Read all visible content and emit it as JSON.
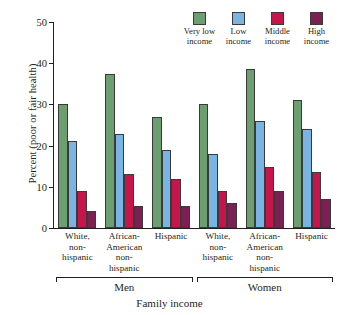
{
  "chart_data": {
    "type": "bar",
    "title": "",
    "xlabel": "Family income",
    "ylabel": "Percent (poor or fair health)",
    "ylim": [
      0,
      50
    ],
    "yticks": [
      0,
      10,
      20,
      30,
      40,
      50
    ],
    "grid": false,
    "legend_position": "top-right",
    "categories": [
      "White, non-hispanic",
      "African-American non-hispanic",
      "Hispanic",
      "White, non-hispanic",
      "African-American non-hispanic",
      "Hispanic"
    ],
    "category_lines": [
      [
        "White,",
        "non-",
        "hispanic"
      ],
      [
        "African-",
        "American",
        "non-",
        "hispanic"
      ],
      [
        "Hispanic"
      ],
      [
        "White,",
        "non-",
        "hispanic"
      ],
      [
        "African-",
        "American",
        "non-",
        "hispanic"
      ],
      [
        "Hispanic"
      ]
    ],
    "supergroups": [
      {
        "label": "Men",
        "span": 3
      },
      {
        "label": "Women",
        "span": 3
      }
    ],
    "series": [
      {
        "name": "Very low income",
        "color": "#6b9f70",
        "values": [
          30.0,
          37.5,
          27.0,
          30.0,
          38.5,
          31.0
        ]
      },
      {
        "name": "Low income",
        "color": "#79b4e2",
        "values": [
          21.0,
          22.7,
          19.0,
          18.0,
          26.0,
          24.0
        ]
      },
      {
        "name": "Middle income",
        "color": "#c6154a",
        "values": [
          9.0,
          13.0,
          12.0,
          9.0,
          14.7,
          13.5
        ]
      },
      {
        "name": "High income",
        "color": "#7c1f53",
        "values": [
          4.2,
          5.3,
          5.3,
          6.1,
          9.0,
          7.0
        ]
      }
    ]
  },
  "legend": [
    {
      "line1": "Very low",
      "line2": "income"
    },
    {
      "line1": "Low",
      "line2": "income"
    },
    {
      "line1": "Middle",
      "line2": "income"
    },
    {
      "line1": "High",
      "line2": "income"
    }
  ]
}
